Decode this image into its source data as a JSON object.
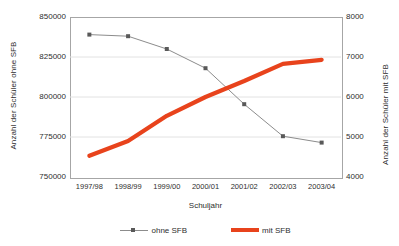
{
  "chart_data": {
    "type": "line",
    "title": "",
    "xlabel": "Schuljahr",
    "categories": [
      "1997/98",
      "1998/99",
      "1999/00",
      "2000/01",
      "2001/02",
      "2002/03",
      "2003/04"
    ],
    "grid": true,
    "legend_position": "bottom",
    "axes": {
      "left": {
        "label": "Anzahl der Schüler ohne SFB",
        "ticks": [
          "750000",
          "775000",
          "800000",
          "825000",
          "850000"
        ],
        "min": 750000,
        "max": 850000,
        "step": 25000
      },
      "right": {
        "label": "Anzahl der Schüler mit SFB",
        "ticks": [
          "4000",
          "5000",
          "6000",
          "7000",
          "8000"
        ],
        "min": 4000,
        "max": 8000,
        "step": 1000
      }
    },
    "series": [
      {
        "name": "ohne SFB",
        "axis": "left",
        "color": "#8c8c8c",
        "marker": "square",
        "marker_color": "#595959",
        "values": [
          839000,
          838000,
          830000,
          818000,
          795500,
          775500,
          771500
        ]
      },
      {
        "name": "mit SFB",
        "axis": "right",
        "color": "#e8431c",
        "marker": "none",
        "values": [
          4530,
          4900,
          5530,
          6000,
          6400,
          6830,
          6930
        ]
      }
    ]
  },
  "legend": {
    "items": [
      {
        "label": "ohne SFB"
      },
      {
        "label": "mit SFB"
      }
    ]
  }
}
